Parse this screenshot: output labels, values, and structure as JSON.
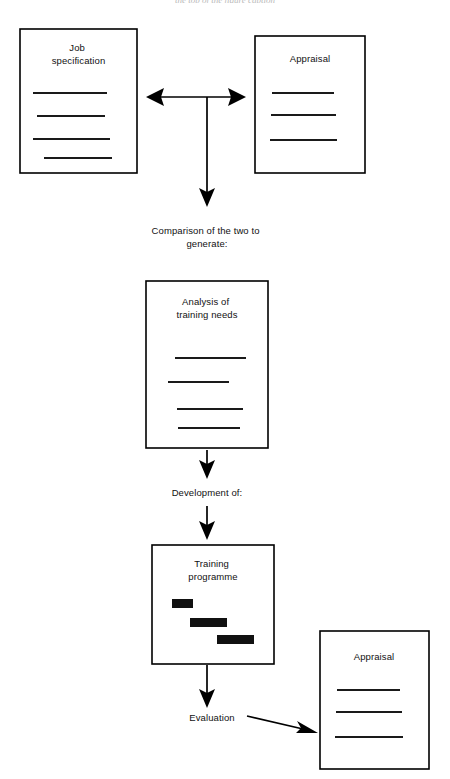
{
  "page": {
    "width": 450,
    "height": 779,
    "background": "#ffffff",
    "ink": "#000000",
    "header_ghost_text": "the top of the figure caption"
  },
  "diagram": {
    "type": "flowchart",
    "boxes": [
      {
        "id": "job-specification",
        "label_lines": [
          "Job",
          "specification"
        ],
        "x": 20,
        "y": 29,
        "w": 117,
        "h": 144,
        "title_y": 51,
        "rules": [
          {
            "x1": 33,
            "x2": 107,
            "y": 93
          },
          {
            "x1": 37,
            "x2": 105,
            "y": 116
          },
          {
            "x1": 33,
            "x2": 110,
            "y": 139
          },
          {
            "x1": 44,
            "x2": 112,
            "y": 158
          }
        ]
      },
      {
        "id": "appraisal-top",
        "label_lines": [
          "Appraisal"
        ],
        "x": 255,
        "y": 36,
        "w": 110,
        "h": 137,
        "title_y": 62,
        "rules": [
          {
            "x1": 272,
            "x2": 334,
            "y": 93
          },
          {
            "x1": 271,
            "x2": 336,
            "y": 115
          },
          {
            "x1": 270,
            "x2": 337,
            "y": 140
          }
        ]
      },
      {
        "id": "analysis-of-training-needs",
        "label_lines": [
          "Analysis of",
          "training needs"
        ],
        "x": 146,
        "y": 281,
        "w": 122,
        "h": 167,
        "title_y": 305,
        "rules": [
          {
            "x1": 175,
            "x2": 246,
            "y": 358
          },
          {
            "x1": 168,
            "x2": 229,
            "y": 382
          },
          {
            "x1": 177,
            "x2": 243,
            "y": 409
          },
          {
            "x1": 178,
            "x2": 240,
            "y": 428
          }
        ]
      },
      {
        "id": "training-programme",
        "label_lines": [
          "Training",
          "programme"
        ],
        "x": 152,
        "y": 545,
        "w": 122,
        "h": 119,
        "title_y": 567,
        "rules": [],
        "bars": [
          {
            "x": 172,
            "y": 599,
            "w": 21,
            "h": 9
          },
          {
            "x": 190,
            "y": 618,
            "w": 37,
            "h": 9
          },
          {
            "x": 217,
            "y": 635,
            "w": 37,
            "h": 9
          }
        ]
      },
      {
        "id": "appraisal-bottom",
        "label_lines": [
          "Appraisal"
        ],
        "x": 320,
        "y": 631,
        "w": 109,
        "h": 138,
        "title_y": 660,
        "rules": [
          {
            "x1": 337,
            "x2": 400,
            "y": 690
          },
          {
            "x1": 336,
            "x2": 402,
            "y": 712
          },
          {
            "x1": 335,
            "x2": 403,
            "y": 737
          }
        ]
      }
    ],
    "labels": [
      {
        "id": "comparison-label",
        "lines": [
          "Comparison of the two to",
          "generate:"
        ],
        "x": 207,
        "y": 234
      },
      {
        "id": "development-label",
        "lines": [
          "Development of:"
        ],
        "x": 207,
        "y": 496
      },
      {
        "id": "evaluation-label",
        "lines": [
          "Evaluation"
        ],
        "x": 212,
        "y": 721
      }
    ],
    "connectors": [
      {
        "id": "comparison-tee",
        "description": "double-headed horizontal arrow joining Job specification and Appraisal, with a vertical stem dropping to the comparison label",
        "kind": "tee-double-arrow",
        "left_tip_x": 146,
        "right_tip_x": 246,
        "horizontal_y": 97,
        "stem_x": 207,
        "stem_bottom_y": 205
      },
      {
        "id": "analysis-to-development",
        "kind": "arrow-down",
        "x": 207,
        "y1": 450,
        "y2": 478
      },
      {
        "id": "development-to-programme",
        "kind": "arrow-down",
        "x": 207,
        "y1": 506,
        "y2": 538
      },
      {
        "id": "programme-to-evaluation",
        "kind": "arrow-down",
        "x": 207,
        "y1": 665,
        "y2": 706
      },
      {
        "id": "evaluation-to-appraisal",
        "kind": "arrow-diagonal",
        "x1": 247,
        "y1": 716,
        "x2": 316,
        "y2": 733
      }
    ]
  }
}
